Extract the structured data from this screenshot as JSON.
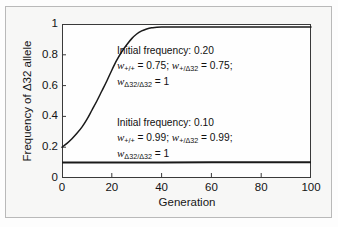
{
  "figure": {
    "background_color": "#f7f7f6",
    "border_color": "#b9b9b9",
    "plot_frame_color": "#3a3a3a",
    "curve_color": "#1a1a1a"
  },
  "axes": {
    "y_title": "Frequency of Δ32 allele",
    "x_title": "Generation",
    "y_ticks": [
      "0",
      "0.2",
      "0.4",
      "0.6",
      "0.8",
      "1"
    ],
    "x_ticks": [
      "0",
      "20",
      "40",
      "60",
      "80",
      "100"
    ]
  },
  "annotations": {
    "block1": {
      "line1": "Initial frequency: 0.20",
      "w_hom_plus": "w",
      "w_hom_plus_sub": "+/+",
      "w_hom_plus_value": " = 0.75; ",
      "w_het": "w",
      "w_het_sub": "+/Δ32",
      "w_het_value": " = 0.75;",
      "w_hom_delta": "w",
      "w_hom_delta_sub": "Δ32/Δ32",
      "w_hom_delta_value": " = 1"
    },
    "block2": {
      "line1": "Initial frequency: 0.10",
      "w_hom_plus": "w",
      "w_hom_plus_sub": "+/+",
      "w_hom_plus_value": " = 0.99; ",
      "w_het": "w",
      "w_het_sub": "+/Δ32",
      "w_het_value": " = 0.99;",
      "w_hom_delta": "w",
      "w_hom_delta_sub": "Δ32/Δ32",
      "w_hom_delta_value": " = 1"
    }
  },
  "chart_data": {
    "type": "line",
    "title": "",
    "xlabel": "Generation",
    "ylabel": "Frequency of Δ32 allele",
    "xlim": [
      0,
      100
    ],
    "ylim": [
      0,
      1
    ],
    "xticks": [
      0,
      20,
      40,
      60,
      80,
      100
    ],
    "yticks": [
      0,
      0.2,
      0.4,
      0.6,
      0.8,
      1
    ],
    "grid": false,
    "legend": "none",
    "annotations_in_plot": [
      "Initial frequency: 0.20; w(+/+) = 0.75; w(+/Δ32) = 0.75; w(Δ32/Δ32) = 1",
      "Initial frequency: 0.10; w(+/+) = 0.99; w(+/Δ32) = 0.99; w(Δ32/Δ32) = 1"
    ],
    "series": [
      {
        "name": "Initial frequency 0.20, strong selection (w+/+ = 0.75)",
        "initial_frequency": 0.2,
        "fitness_plus_plus": 0.75,
        "fitness_plus_delta32": 0.75,
        "fitness_delta32_delta32": 1,
        "x": [
          0,
          2,
          4,
          6,
          8,
          10,
          12,
          14,
          16,
          18,
          20,
          22,
          24,
          26,
          28,
          30,
          32,
          34,
          36,
          40,
          50,
          60,
          70,
          80,
          90,
          100
        ],
        "values": [
          0.2,
          0.225,
          0.255,
          0.29,
          0.33,
          0.38,
          0.44,
          0.5,
          0.565,
          0.63,
          0.7,
          0.765,
          0.82,
          0.865,
          0.905,
          0.935,
          0.955,
          0.968,
          0.975,
          0.98,
          0.98,
          0.98,
          0.98,
          0.98,
          0.98,
          0.98
        ]
      },
      {
        "name": "Initial frequency 0.10, weak selection (w+/+ = 0.99)",
        "initial_frequency": 0.1,
        "fitness_plus_plus": 0.99,
        "fitness_plus_delta32": 0.99,
        "fitness_delta32_delta32": 1,
        "x": [
          0,
          20,
          40,
          60,
          80,
          100
        ],
        "values": [
          0.1,
          0.1,
          0.1,
          0.102,
          0.102,
          0.103
        ]
      }
    ]
  }
}
